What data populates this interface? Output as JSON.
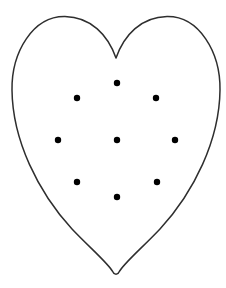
{
  "figure": {
    "background_color": "#ffffff",
    "outline_color": "#2e2e2e",
    "outline_stroke_width": 1.5,
    "heart_path": "M 116 58 C 108 35, 91 17, 65 16.5 C 33 16, 11.5 52, 12 90 C 12.5 140, 38 192, 72 229 C 90 248, 108 263, 113 272 C 114 275, 118 275, 119 272 C 124 263, 142 248, 160 229 C 194 192, 219.5 140, 220 90 C 220.5 52, 199 16, 167 16.5 C 141 17, 124 35, 116 58 Z",
    "dot_color": "#000000",
    "dot_radius": 3.2,
    "dot_count": 9,
    "dots": [
      {
        "x": 117,
        "y": 83,
        "position": "top"
      },
      {
        "x": 77,
        "y": 98,
        "position": "upper-left"
      },
      {
        "x": 156,
        "y": 98,
        "position": "upper-right"
      },
      {
        "x": 58,
        "y": 140,
        "position": "left"
      },
      {
        "x": 117,
        "y": 140,
        "position": "center"
      },
      {
        "x": 175,
        "y": 140,
        "position": "right"
      },
      {
        "x": 77,
        "y": 182,
        "position": "lower-left"
      },
      {
        "x": 157,
        "y": 182,
        "position": "lower-right"
      },
      {
        "x": 117,
        "y": 197,
        "position": "bottom"
      }
    ]
  }
}
